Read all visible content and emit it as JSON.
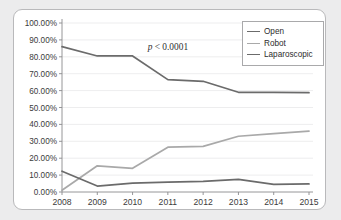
{
  "chart_data": {
    "type": "line",
    "title": "",
    "xlabel": "",
    "ylabel": "",
    "x": [
      "2008",
      "2009",
      "2010",
      "2011",
      "2012",
      "2013",
      "2014",
      "2015"
    ],
    "categories": [
      "2008",
      "2009",
      "2010",
      "2011",
      "2012",
      "2013",
      "2014",
      "2015"
    ],
    "ylim": [
      0,
      100
    ],
    "ytick_labels": [
      "0.00%",
      "10.00%",
      "20.00%",
      "30.00%",
      "40.00%",
      "50.00%",
      "60.00%",
      "70.00%",
      "80.00%",
      "90.00%",
      "100.00%"
    ],
    "ytick_values": [
      0,
      10,
      20,
      30,
      40,
      50,
      60,
      70,
      80,
      90,
      100
    ],
    "grid": true,
    "legend_position": "top-right",
    "series": [
      {
        "name": "Open",
        "color": "#6b6b6b",
        "values": [
          86.0,
          80.5,
          80.5,
          66.5,
          65.5,
          59.0,
          59.0,
          58.8
        ]
      },
      {
        "name": "Robot",
        "color": "#a9a9a9",
        "values": [
          1.0,
          15.5,
          14.0,
          26.5,
          27.0,
          33.0,
          34.5,
          36.0
        ]
      },
      {
        "name": "Laparoscopic",
        "color": "#6b6b6b",
        "values": [
          12.3,
          3.5,
          5.2,
          5.8,
          6.3,
          7.5,
          4.5,
          4.8
        ]
      }
    ],
    "annotations": [
      {
        "text_prefix": "p",
        "text_suffix": " < 0.0001",
        "full_text": "p < 0.0001",
        "x": 2011.0,
        "y": 84.0
      }
    ]
  },
  "legend": {
    "items": [
      {
        "label": "Open"
      },
      {
        "label": "Robot"
      },
      {
        "label": "Laparoscopic"
      }
    ]
  }
}
